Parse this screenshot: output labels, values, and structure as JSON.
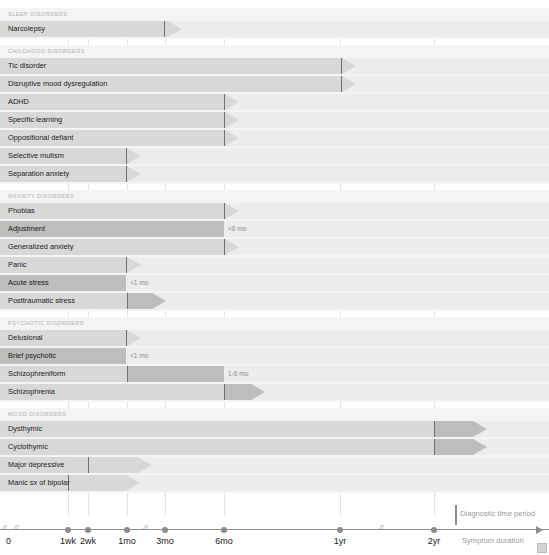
{
  "figure": {
    "axis_label_right": "Symptom duration",
    "legend_label": "Diagnostic time period",
    "top_cut_text": ""
  },
  "chart_data": {
    "type": "bar",
    "xlabel": "Symptom duration",
    "ylabel": "",
    "grid": true,
    "legend": [
      "Diagnostic time period"
    ],
    "axis_ticks": [
      {
        "label": "0",
        "x": 10
      },
      {
        "label": "1wk",
        "x": 68
      },
      {
        "label": "2wk",
        "x": 88
      },
      {
        "label": "1mo",
        "x": 127
      },
      {
        "label": "3mo",
        "x": 165
      },
      {
        "label": "6mo",
        "x": 224
      },
      {
        "label": "1yr",
        "x": 340
      },
      {
        "label": "2yr",
        "x": 434
      }
    ],
    "axis_breaks": [
      14,
      143,
      379
    ],
    "sections": [
      {
        "title": "SLEEP DISORDERS",
        "rows": [
          {
            "label": "Narcolepsy",
            "marker_x": 164,
            "tip_x": 182,
            "bar_start": 0,
            "dark_start": null,
            "dark_end": null,
            "duration_label": ""
          }
        ]
      },
      {
        "title": "CHILDHOOD DISORDERS",
        "rows": [
          {
            "label": "Tic disorder",
            "marker_x": 341,
            "tip_x": 356,
            "bar_start": 0,
            "dark_start": null,
            "dark_end": null,
            "duration_label": ""
          },
          {
            "label": "Disruptive mood dysregulation",
            "marker_x": 341,
            "tip_x": 356,
            "bar_start": 0,
            "dark_start": null,
            "dark_end": null,
            "duration_label": ""
          },
          {
            "label": "ADHD",
            "marker_x": 224,
            "tip_x": 239,
            "bar_start": 0,
            "dark_start": null,
            "dark_end": null,
            "duration_label": ""
          },
          {
            "label": "Specific learning",
            "marker_x": 224,
            "tip_x": 239,
            "bar_start": 0,
            "dark_start": null,
            "dark_end": null,
            "duration_label": ""
          },
          {
            "label": "Oppositional defiant",
            "marker_x": 224,
            "tip_x": 239,
            "bar_start": 0,
            "dark_start": null,
            "dark_end": null,
            "duration_label": ""
          },
          {
            "label": "Selective mutism",
            "marker_x": 126,
            "tip_x": 141,
            "bar_start": 0,
            "dark_start": null,
            "dark_end": null,
            "duration_label": ""
          },
          {
            "label": "Separation anxiety",
            "marker_x": 126,
            "tip_x": 141,
            "bar_start": 0,
            "dark_start": null,
            "dark_end": null,
            "duration_label": ""
          }
        ]
      },
      {
        "title": "ANXIETY DISORDERS",
        "rows": [
          {
            "label": "Phobias",
            "marker_x": 224,
            "tip_x": 239,
            "bar_start": 0,
            "dark_start": null,
            "dark_end": null,
            "duration_label": ""
          },
          {
            "label": "Adjustment",
            "marker_x": null,
            "tip_x": null,
            "bar_start": 0,
            "dark_start": 0,
            "dark_end": 224,
            "duration_label": "<6 mo",
            "duration_x": 228
          },
          {
            "label": "Generalized anxiety",
            "marker_x": 224,
            "tip_x": 239,
            "bar_start": 0,
            "dark_start": null,
            "dark_end": null,
            "duration_label": ""
          },
          {
            "label": "Panic",
            "marker_x": 126,
            "tip_x": 141,
            "bar_start": 0,
            "dark_start": null,
            "dark_end": null,
            "duration_label": ""
          },
          {
            "label": "Acute stress",
            "marker_x": null,
            "tip_x": null,
            "bar_start": 0,
            "dark_start": 0,
            "dark_end": 126,
            "duration_label": "<1 mo",
            "duration_x": 130
          },
          {
            "label": "Posttraumatic stress",
            "marker_x": 127,
            "tip_x": 166,
            "bar_start": 0,
            "dark_start": 128,
            "dark_end": 152,
            "duration_label": ""
          }
        ]
      },
      {
        "title": "PSYCHOTIC DISORDERS",
        "rows": [
          {
            "label": "Delusional",
            "marker_x": 126,
            "tip_x": 141,
            "bar_start": 0,
            "dark_start": null,
            "dark_end": null,
            "duration_label": ""
          },
          {
            "label": "Brief psychotic",
            "marker_x": null,
            "tip_x": null,
            "bar_start": 0,
            "dark_start": 0,
            "dark_end": 126,
            "duration_label": "<1 mo",
            "duration_x": 130
          },
          {
            "label": "Schizophreniform",
            "marker_x": 127,
            "tip_x": null,
            "bar_start": 0,
            "dark_start": 127,
            "dark_end": 224,
            "duration_label": "1-6 mo",
            "duration_x": 228
          },
          {
            "label": "Schizophrenia",
            "marker_x": 224,
            "tip_x": 265,
            "bar_start": 0,
            "dark_start": 224,
            "dark_end": 251,
            "duration_label": ""
          }
        ]
      },
      {
        "title": "MOOD DISORDERS",
        "rows": [
          {
            "label": "Dysthymic",
            "marker_x": 434,
            "tip_x": 487,
            "bar_start": 0,
            "dark_start": 435,
            "dark_end": 473,
            "duration_label": ""
          },
          {
            "label": "Cyclothymic",
            "marker_x": 434,
            "tip_x": 487,
            "bar_start": 0,
            "dark_start": 435,
            "dark_end": 473,
            "duration_label": ""
          },
          {
            "label": "Major depressive",
            "marker_x": 88,
            "tip_x": 152,
            "bar_start": 0,
            "dark_start": null,
            "dark_end": null,
            "duration_label": ""
          },
          {
            "label": "Manic sx of bipolar",
            "marker_x": 68,
            "tip_x": 140,
            "bar_start": 0,
            "dark_start": null,
            "dark_end": null,
            "duration_label": ""
          }
        ]
      }
    ]
  }
}
